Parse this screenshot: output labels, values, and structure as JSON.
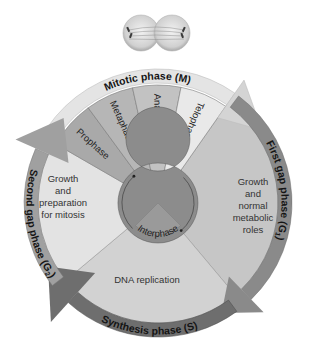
{
  "diagram": {
    "mitotic_phase": {
      "label": "Mitotic phase (M)",
      "color": "#e4e4e4"
    },
    "mitosis_stages": [
      {
        "label": "Prophase",
        "color": "#a9a9a9"
      },
      {
        "label": "Metaphase",
        "color": "#b6b6b6"
      },
      {
        "label": "Anaphase",
        "color": "#c2c2c2"
      },
      {
        "label": "Telophase",
        "color": "#e9e9e9"
      }
    ],
    "g1": {
      "label": "First gap phase (G",
      "sub": "1",
      "end": ")",
      "description": [
        "Growth",
        "and",
        "normal",
        "metabolic",
        "roles"
      ],
      "fill": "#c6c6c6",
      "band": "#8a8a8a"
    },
    "s": {
      "label": "Synthesis phase (S)",
      "description": [
        "DNA replication"
      ],
      "fill": "#d2d2d2",
      "band": "#6e6e6e"
    },
    "g2": {
      "label": "Second gap phase (G",
      "sub": "2",
      "end": ")",
      "description": [
        "Growth",
        "and",
        "preparation",
        "for mitosis"
      ],
      "fill": "#e3e3e3",
      "band": "#a0a0a0"
    },
    "interphase": {
      "label": "Interphase",
      "ring_color": "#8c8c8c",
      "center_color": "#9a9a9a"
    },
    "cell_image": {
      "description": "dividing cell in telophase"
    }
  }
}
